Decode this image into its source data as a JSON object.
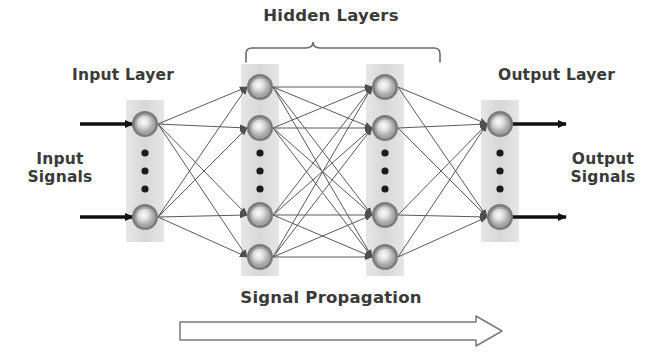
{
  "figure": {
    "type": "neural-network-diagram",
    "background_color": "#ffffff",
    "ink_color": "#3a3a3a"
  },
  "labels": {
    "hidden_layers": "Hidden Layers",
    "input_layer": "Input Layer",
    "output_layer": "Output Layer",
    "input_signals": "Input\nSignals",
    "output_signals": "Output\nSignals",
    "signal_propagation": "Signal Propagation"
  },
  "layers": [
    {
      "id": "input",
      "name": "Input Layer",
      "x": 145,
      "node_count_shown": 2,
      "has_ellipsis": true,
      "nodes_y": [
        124,
        217
      ],
      "band": {
        "x": 126,
        "y": 100,
        "width": 38,
        "height": 142
      }
    },
    {
      "id": "hidden-1",
      "name": "Hidden Layer 1",
      "x": 260,
      "node_count_shown": 4,
      "has_ellipsis": true,
      "nodes_y": [
        87,
        128,
        215,
        257
      ],
      "band": {
        "x": 241,
        "y": 64,
        "width": 38,
        "height": 212
      }
    },
    {
      "id": "hidden-2",
      "name": "Hidden Layer 2",
      "x": 385,
      "node_count_shown": 4,
      "has_ellipsis": true,
      "nodes_y": [
        87,
        128,
        215,
        257
      ],
      "band": {
        "x": 366,
        "y": 64,
        "width": 38,
        "height": 212
      }
    },
    {
      "id": "output",
      "name": "Output Layer",
      "x": 500,
      "node_count_shown": 2,
      "has_ellipsis": true,
      "nodes_y": [
        124,
        217
      ],
      "band": {
        "x": 481,
        "y": 100,
        "width": 38,
        "height": 142
      }
    }
  ],
  "node_style": {
    "outer_radius": 13,
    "ring_radius": 10.5,
    "core_radius": 7,
    "outer_color": "#6f6f6f",
    "ring_color": "#8d8d8d",
    "core_color": "#e8e8e8"
  },
  "ellipsis": {
    "dot_count": 3,
    "dot_radius": 3.4,
    "dot_color": "#1c1c1c",
    "spacing": 17
  },
  "band_style": {
    "fill_color": "#c9c9c9",
    "opacity": 0.55
  },
  "connections": {
    "color": "#5a5a5a",
    "width": 1,
    "style": "fully-connected-between-adjacent-layers"
  },
  "signal_arrows": {
    "color": "#111111",
    "input_arrows": [
      {
        "from_x": 80,
        "to_x": 131,
        "y": 124
      },
      {
        "from_x": 80,
        "to_x": 131,
        "y": 217
      }
    ],
    "output_arrows": [
      {
        "from_x": 514,
        "to_x": 566,
        "y": 124
      },
      {
        "from_x": 514,
        "to_x": 566,
        "y": 217
      }
    ]
  },
  "brace": {
    "label": "Hidden Layers",
    "left_x": 246,
    "right_x": 440,
    "peak_x": 313,
    "top_y": 42,
    "bottom_y": 62
  },
  "propagation_arrow": {
    "direction": "right",
    "x_start": 180,
    "x_end": 502,
    "y_center": 330,
    "shaft_height": 16,
    "head_width": 26,
    "head_height": 28,
    "fill": "#ffffff",
    "stroke": "#7a7a7a"
  }
}
